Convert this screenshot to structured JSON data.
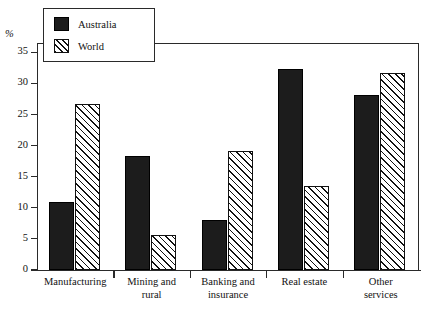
{
  "chart_data": {
    "type": "bar",
    "title": "",
    "subtitle": "",
    "xlabel": "",
    "ylabel": "%",
    "ylim": [
      0,
      36.5
    ],
    "yticks": [
      0,
      5,
      10,
      15,
      20,
      25,
      30,
      35
    ],
    "ytick_labels": [
      "0",
      "5",
      "10",
      "15",
      "20",
      "25",
      "30",
      "35"
    ],
    "grid": false,
    "legend_position": "top-left",
    "categories": [
      "Manufacturing",
      "Mining and rural",
      "Banking and insurance",
      "Real estate",
      "Other services"
    ],
    "category_lines": [
      [
        "Manufacturing"
      ],
      [
        "Mining and",
        "rural"
      ],
      [
        "Banking and",
        "insurance"
      ],
      [
        "Real estate"
      ],
      [
        "Other",
        "services"
      ]
    ],
    "series": [
      {
        "name": "Australia",
        "color": "#1c1c1c",
        "fill": "solid",
        "values": [
          10.9,
          18.3,
          8.0,
          32.4,
          28.1
        ]
      },
      {
        "name": "World",
        "color": "#ffffff",
        "fill": "diagonal-hatch",
        "values": [
          26.7,
          5.7,
          19.2,
          13.5,
          31.7
        ]
      }
    ]
  },
  "legend": {
    "items": [
      {
        "label": "Australia",
        "swatch": "solid-black-square"
      },
      {
        "label": "World",
        "swatch": "hatched-square"
      }
    ]
  },
  "axis": {
    "unit_label": "%"
  }
}
